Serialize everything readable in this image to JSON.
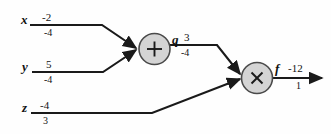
{
  "figure": {
    "background_color": "#fefefe",
    "line_color": "#1a1a1a",
    "node_fill": "#d4d4d4",
    "node_stroke": "#4a4a4a",
    "text_color": "#111111"
  },
  "inputs": [
    {
      "name": "x",
      "value": "-2",
      "gradient": "-4"
    },
    {
      "name": "y",
      "value": "5",
      "gradient": "-4"
    },
    {
      "name": "z",
      "value": "-4",
      "gradient": "3"
    }
  ],
  "gates": [
    {
      "id": "add",
      "symbol": "+",
      "icon": "plus-gate-icon",
      "out_name": "q",
      "out_value": "3",
      "out_gradient": "-4"
    },
    {
      "id": "mul",
      "symbol": "×",
      "icon": "multiply-gate-icon",
      "out_name": "f",
      "out_value": "-12",
      "out_gradient": "1"
    }
  ]
}
